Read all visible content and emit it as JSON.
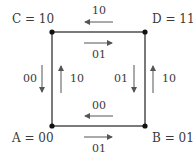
{
  "diagram": {
    "type": "state-transition-square",
    "nodes": [
      {
        "id": "A",
        "label": "A = 00",
        "position": "bottom-left"
      },
      {
        "id": "B",
        "label": "B = 01",
        "position": "bottom-right"
      },
      {
        "id": "C",
        "label": "C = 10",
        "position": "top-left"
      },
      {
        "id": "D",
        "label": "D = 11",
        "position": "top-right"
      }
    ],
    "edges": [
      {
        "side": "top",
        "from": "D",
        "to": "C",
        "label": "10",
        "direction": "left"
      },
      {
        "side": "top",
        "from": "C",
        "to": "D",
        "label": "01",
        "direction": "right"
      },
      {
        "side": "left",
        "from": "C",
        "to": "A",
        "label": "00",
        "direction": "down"
      },
      {
        "side": "left",
        "from": "A",
        "to": "C",
        "label": "10",
        "direction": "up"
      },
      {
        "side": "right",
        "from": "D",
        "to": "B",
        "label": "01",
        "direction": "down"
      },
      {
        "side": "right",
        "from": "B",
        "to": "D",
        "label": "10",
        "direction": "up"
      },
      {
        "side": "bottom",
        "from": "B",
        "to": "A",
        "label": "00",
        "direction": "left"
      },
      {
        "side": "bottom",
        "from": "A",
        "to": "B",
        "label": "01",
        "direction": "right"
      }
    ],
    "colors": {
      "line": "#333333",
      "arrow": "#555555",
      "text": "#3a3a3a"
    }
  }
}
